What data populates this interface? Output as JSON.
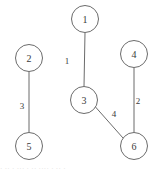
{
  "figure": {
    "kind": "undirected-weighted-graph",
    "background_color": "#ffffff",
    "stroke_color": "#6b6b6b",
    "text_color": "#3a3a3a",
    "width": 162,
    "height": 173
  },
  "chart_data": {
    "type": "diagram",
    "title": "",
    "xlabel": "",
    "ylabel": "",
    "graph_type": "undirected weighted graph",
    "nodes": [
      {
        "id": "1",
        "label": "1",
        "cx": 85,
        "cy": 19,
        "r": 13.5
      },
      {
        "id": "2",
        "label": "2",
        "cx": 29,
        "cy": 58,
        "r": 13.5
      },
      {
        "id": "3",
        "label": "3",
        "cx": 84,
        "cy": 100,
        "r": 13.5
      },
      {
        "id": "4",
        "label": "4",
        "cx": 134,
        "cy": 54,
        "r": 13.5
      },
      {
        "id": "5",
        "label": "5",
        "cx": 29,
        "cy": 146,
        "r": 13.5
      },
      {
        "id": "6",
        "label": "6",
        "cx": 134,
        "cy": 146,
        "r": 13.5
      }
    ],
    "edges": [
      {
        "source": "1",
        "target": "3",
        "weight": "1",
        "x1": 85,
        "y1": 32.5,
        "x2": 84,
        "y2": 86.5,
        "label_x": 67,
        "label_y": 61
      },
      {
        "source": "2",
        "target": "5",
        "weight": "3",
        "x1": 29,
        "y1": 71.5,
        "x2": 29,
        "y2": 132.5,
        "label_x": 22,
        "label_y": 106
      },
      {
        "source": "4",
        "target": "6",
        "weight": "2",
        "x1": 134,
        "y1": 67.5,
        "x2": 134,
        "y2": 132.5,
        "label_x": 138,
        "label_y": 101
      },
      {
        "source": "3",
        "target": "6",
        "weight": "4",
        "x1": 95.5,
        "y1": 107,
        "x2": 123,
        "y2": 138,
        "label_x": 114,
        "label_y": 114
      }
    ]
  },
  "caption": {
    "smudge_text": "· ··  · ··· ·  ·· ···· · ·· ·"
  }
}
